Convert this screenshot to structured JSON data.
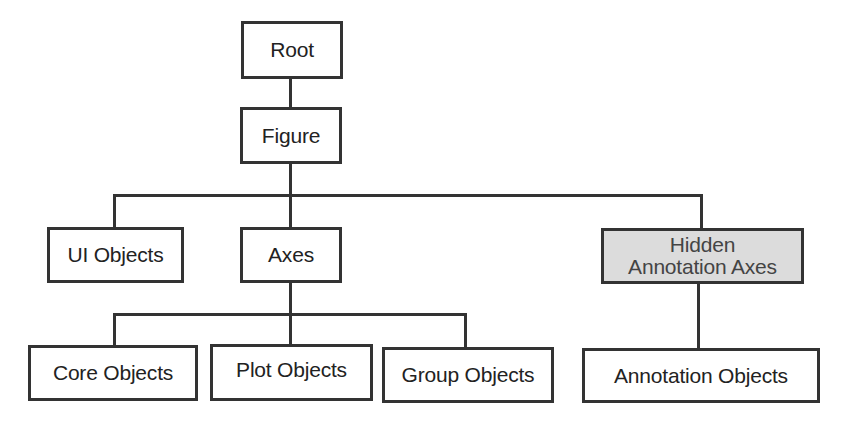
{
  "diagram": {
    "type": "hierarchy-tree",
    "nodes": {
      "root": {
        "label": "Root"
      },
      "figure": {
        "label": "Figure"
      },
      "ui_objects": {
        "label": "UI Objects"
      },
      "axes": {
        "label": "Axes"
      },
      "hidden_annotation_axes": {
        "line1": "Hidden",
        "line2": "Annotation Axes",
        "fill": "#dcdcdc"
      },
      "core_objects": {
        "label": "Core Objects"
      },
      "plot_objects": {
        "label": "Plot Objects"
      },
      "group_objects": {
        "label": "Group Objects"
      },
      "annotation_objects": {
        "label": "Annotation Objects"
      }
    },
    "edges": [
      [
        "Root",
        "Figure"
      ],
      [
        "Figure",
        "UI Objects"
      ],
      [
        "Figure",
        "Axes"
      ],
      [
        "Figure",
        "Hidden Annotation Axes"
      ],
      [
        "Axes",
        "Core Objects"
      ],
      [
        "Axes",
        "Plot Objects"
      ],
      [
        "Axes",
        "Group Objects"
      ],
      [
        "Hidden Annotation Axes",
        "Annotation Objects"
      ]
    ],
    "colors": {
      "stroke": "#333333",
      "text": "#222222",
      "hidden_fill": "#dcdcdc"
    }
  }
}
